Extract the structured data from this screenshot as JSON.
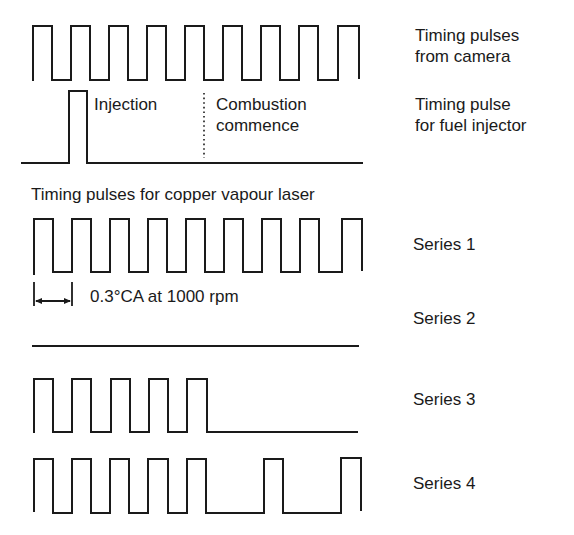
{
  "diagram": {
    "labels": {
      "camera_line1": "Timing pulses",
      "camera_line2": "from camera",
      "injector_line1": "Timing pulse",
      "injector_line2": "for fuel injector",
      "injection": "Injection",
      "combustion_line1": "Combustion",
      "combustion_line2": "commence",
      "laser_title": "Timing pulses for copper vapour laser",
      "dimension": "0.3°CA at 1000 rpm",
      "series1": "Series 1",
      "series2": "Series 2",
      "series3": "Series 3",
      "series4": "Series 4"
    },
    "stroke_color": "#1a1a1a",
    "background_color": "#ffffff",
    "signals": [
      {
        "name": "camera",
        "pulse_count": 9,
        "pattern": "111111111"
      },
      {
        "name": "fuel_injector",
        "pulse_count": 1,
        "pattern": "single pulse",
        "combustion_marker": "dotted line"
      },
      {
        "name": "series1",
        "pulse_count": 9,
        "pattern": "111111111"
      },
      {
        "name": "series2",
        "pulse_count": 0,
        "pattern": "flat"
      },
      {
        "name": "series3",
        "pulse_count": 5,
        "pattern": "111110000"
      },
      {
        "name": "series4",
        "pulse_count": 7,
        "pattern": "111110101"
      }
    ]
  }
}
